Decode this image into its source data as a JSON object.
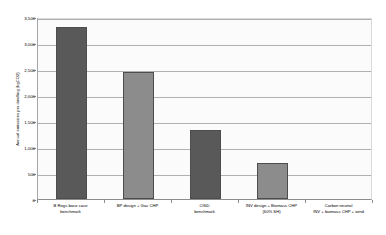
{
  "chart_data": {
    "type": "bar",
    "title": "",
    "xlabel": "",
    "ylabel": "Annual emissions per dwelling (kgCO2)",
    "ylim": [
      0,
      3500
    ],
    "grid": true,
    "legend": "none",
    "y_ticks": [
      "0",
      "500",
      "1,000",
      "1,500",
      "2,000",
      "2,500",
      "3,000",
      "3,500"
    ],
    "y_tick_values": [
      0,
      500,
      1000,
      1500,
      2000,
      2500,
      3000,
      3500
    ],
    "categories": [
      "B Regs base case benchmark",
      "BP design + Gas CHP",
      "CfSD benchmark",
      "INV design + Biomass CHP (60% SH)",
      "Carbon neutral INV + biomass CHP + wind"
    ],
    "category_lines": [
      [
        "B Regs base case",
        "benchmark"
      ],
      [
        "BP design + Gas CHP"
      ],
      [
        "CfSD",
        "benchmark"
      ],
      [
        "INV design + Biomass CHP",
        "(60% SH)"
      ],
      [
        "Carbon neutral",
        "INV + biomass CHP + wind"
      ]
    ],
    "values": [
      3300,
      2450,
      1330,
      700,
      0
    ],
    "bar_colors": [
      "#595959",
      "#8c8c8c",
      "#595959",
      "#8c8c8c",
      "#595959"
    ]
  },
  "colors": {
    "plot_background": "#fbfbfb",
    "gridline": "#b0b0b0",
    "axis": "#8c8c8c",
    "bar_dark": "#595959",
    "bar_light": "#8c8c8c",
    "text": "#000000"
  }
}
